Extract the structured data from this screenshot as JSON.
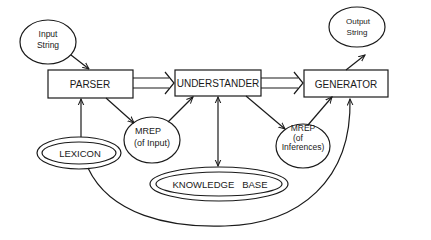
{
  "diagram": {
    "title": "",
    "nodes": {
      "input_string": {
        "line1": "Input",
        "line2": "String",
        "shape": "ellipse"
      },
      "output_string": {
        "line1": "Output",
        "line2": "String",
        "shape": "ellipse"
      },
      "parser": {
        "label": "PARSER",
        "shape": "rectangle"
      },
      "understander": {
        "label": "UNDERSTANDER",
        "shape": "rectangle"
      },
      "generator": {
        "label": "GENERATOR",
        "shape": "rectangle"
      },
      "mrep_input": {
        "line1": "MREP",
        "line2": "(of Input)",
        "shape": "ellipse"
      },
      "mrep_inferences": {
        "line1": "MREP",
        "line2": "(of",
        "line3": "Inferences)",
        "shape": "ellipse"
      },
      "lexicon": {
        "label": "LEXICON",
        "shape": "double-ellipse"
      },
      "knowledge_base": {
        "label": "KNOWLEDGE   BASE",
        "shape": "double-ellipse"
      }
    },
    "edges": [
      {
        "from": "input_string",
        "to": "parser",
        "style": "single-arrow"
      },
      {
        "from": "parser",
        "to": "understander",
        "style": "double-line-arrow"
      },
      {
        "from": "understander",
        "to": "generator",
        "style": "double-line-arrow"
      },
      {
        "from": "generator",
        "to": "output_string",
        "style": "single-arrow"
      },
      {
        "from": "parser",
        "to": "mrep_input",
        "style": "single-arrow"
      },
      {
        "from": "mrep_input",
        "to": "understander",
        "style": "single-arrow"
      },
      {
        "from": "understander",
        "to": "mrep_inferences",
        "style": "single-arrow"
      },
      {
        "from": "mrep_inferences",
        "to": "generator",
        "style": "single-arrow"
      },
      {
        "from": "lexicon",
        "to": "parser",
        "style": "single-arrow"
      },
      {
        "from": "lexicon",
        "to": "generator",
        "style": "curved-arrow"
      },
      {
        "from": "understander",
        "to": "knowledge_base",
        "style": "bidirectional-arrow"
      }
    ],
    "colors": {
      "ink": "#1a1a1a",
      "background": "#ffffff"
    }
  }
}
